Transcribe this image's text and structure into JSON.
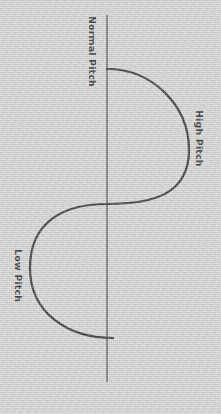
{
  "diagram": {
    "background_color": "#d3d3d2",
    "stroke_color": "#2b2b2f",
    "axis_color": "#4a4a55",
    "labels": {
      "normal_pitch": "Normal Pitch",
      "high_pitch": "High Pitch",
      "low_pitch": "Low Pitch"
    },
    "axis": {
      "name": "baseline-axis",
      "orientation": "vertical",
      "x": 107,
      "y_start": 15,
      "y_end": 382,
      "stroke_width": 1.4
    },
    "curve": {
      "name": "pitch-wave",
      "description": "S-shaped sine curve rotated 90 degrees; bulges right for high pitch, left for low pitch",
      "stroke_width": 2.2,
      "start_point": [
        107,
        69
      ],
      "crossing_point": [
        107,
        204
      ],
      "end_point": [
        113,
        338
      ],
      "right_extreme": [
        189,
        150
      ],
      "left_extreme": [
        30,
        268
      ],
      "path": "M 107 69 C 152 69 189 105 189 150 C 189 195 152 204 107 204 C 62 204 30 223 30 268 C 30 313 68 338 113 338"
    }
  },
  "chart_data": {
    "type": "line",
    "xlabel": "",
    "ylabel": "",
    "orientation": "vertical-axis",
    "axis_labels": [
      "Normal Pitch",
      "High Pitch",
      "Low Pitch"
    ],
    "series": [
      {
        "name": "pitch",
        "points": [
          [
            0,
            0
          ],
          [
            82,
            81
          ],
          [
            135,
            0
          ],
          [
            199,
            -77
          ],
          [
            269,
            6
          ]
        ]
      }
    ],
    "annotations": [
      {
        "text": "Normal Pitch",
        "at": "baseline top"
      },
      {
        "text": "High Pitch",
        "at": "right peak"
      },
      {
        "text": "Low Pitch",
        "at": "left trough"
      }
    ],
    "grid": false,
    "legend": false
  }
}
